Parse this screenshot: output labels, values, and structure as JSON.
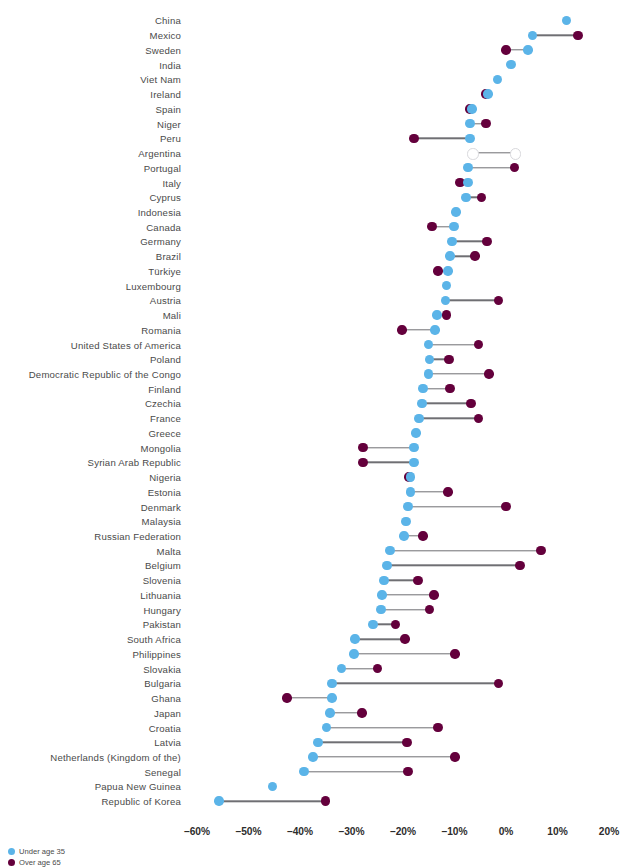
{
  "chart_data": {
    "type": "scatter",
    "subtype": "dumbbell",
    "title": "",
    "xlabel": "",
    "ylabel": "",
    "xlim": [
      -65,
      22
    ],
    "grid": false,
    "legend_position": "bottom-left",
    "axis_ticks": [
      "–60%",
      "–50%",
      "–40%",
      "–30%",
      "–20%",
      "–10%",
      "0%",
      "10%",
      "20%"
    ],
    "axis_tick_values": [
      -60,
      -50,
      -40,
      -30,
      -20,
      -10,
      0,
      10,
      20
    ],
    "series": [
      {
        "name": "Under age 35",
        "color": "#5bb4e8"
      },
      {
        "name": "Over age 65",
        "color": "#64003c"
      }
    ],
    "categories": [
      "China",
      "Mexico",
      "Sweden",
      "India",
      "Viet Nam",
      "Ireland",
      "Spain",
      "Niger",
      "Peru",
      "Argentina",
      "Portugal",
      "Italy",
      "Cyprus",
      "Indonesia",
      "Canada",
      "Germany",
      "Brazil",
      "Türkiye",
      "Luxembourg",
      "Austria",
      "Mali",
      "Romania",
      "United States of America",
      "Poland",
      "Democratic Republic of the Congo",
      "Finland",
      "Czechia",
      "France",
      "Greece",
      "Mongolia",
      "Syrian Arab Republic",
      "Nigeria",
      "Estonia",
      "Denmark",
      "Malaysia",
      "Russian Federation",
      "Malta",
      "Belgium",
      "Slovenia",
      "Lithuania",
      "Hungary",
      "Pakistan",
      "South Africa",
      "Philippines",
      "Slovakia",
      "Bulgaria",
      "Ghana",
      "Japan",
      "Croatia",
      "Latvia",
      "Netherlands (Kingdom of the)",
      "Senegal",
      "Papua New Guinea",
      "Republic of Korea"
    ],
    "rows": [
      {
        "label": "China",
        "under35": 11.7,
        "over65": null
      },
      {
        "label": "Mexico",
        "under35": 5.2,
        "over65": 14.0
      },
      {
        "label": "Sweden",
        "under35": 4.3,
        "over65": 0.0
      },
      {
        "label": "India",
        "under35": 1.0,
        "over65": null
      },
      {
        "label": "Viet Nam",
        "under35": -1.6,
        "over65": null
      },
      {
        "label": "Ireland",
        "under35": -3.5,
        "over65": -3.9
      },
      {
        "label": "Spain",
        "under35": -6.6,
        "over65": -7.0
      },
      {
        "label": "Niger",
        "under35": -7.0,
        "over65": -3.9
      },
      {
        "label": "Peru",
        "under35": -7.0,
        "over65": -17.9
      },
      {
        "label": "Argentina",
        "under35": -6.6,
        "over65": 1.7,
        "hollow": true
      },
      {
        "label": "Portugal",
        "under35": -7.4,
        "over65": 1.7
      },
      {
        "label": "Italy",
        "under35": -7.4,
        "over65": -8.9
      },
      {
        "label": "Cyprus",
        "under35": -7.8,
        "over65": -4.7
      },
      {
        "label": "Indonesia",
        "under35": -9.7,
        "over65": null
      },
      {
        "label": "Canada",
        "under35": -10.1,
        "over65": -14.4
      },
      {
        "label": "Germany",
        "under35": -10.5,
        "over65": -3.7
      },
      {
        "label": "Brazil",
        "under35": -10.9,
        "over65": -6.0
      },
      {
        "label": "Türkiye",
        "under35": -11.3,
        "over65": -13.2
      },
      {
        "label": "Luxembourg",
        "under35": -11.5,
        "over65": null
      },
      {
        "label": "Austria",
        "under35": -11.8,
        "over65": -1.4
      },
      {
        "label": "Mali",
        "under35": -13.4,
        "over65": -11.5
      },
      {
        "label": "Romania",
        "under35": -13.8,
        "over65": -20.2
      },
      {
        "label": "United States of America",
        "under35": -15.1,
        "over65": -5.4
      },
      {
        "label": "Poland",
        "under35": -14.8,
        "over65": -11.1
      },
      {
        "label": "Democratic Republic of the Congo",
        "under35": -15.0,
        "over65": -3.3
      },
      {
        "label": "Finland",
        "under35": -16.1,
        "over65": -10.9
      },
      {
        "label": "Czechia",
        "under35": -16.3,
        "over65": -6.8
      },
      {
        "label": "France",
        "under35": -16.9,
        "over65": -5.4
      },
      {
        "label": "Greece",
        "under35": -17.5,
        "over65": null
      },
      {
        "label": "Mongolia",
        "under35": -17.9,
        "over65": -27.8
      },
      {
        "label": "Syrian Arab Republic",
        "under35": -17.9,
        "over65": -27.8
      },
      {
        "label": "Nigeria",
        "under35": -18.6,
        "over65": -18.8
      },
      {
        "label": "Estonia",
        "under35": -18.6,
        "over65": -11.3
      },
      {
        "label": "Denmark",
        "under35": -19.0,
        "over65": 0.0
      },
      {
        "label": "Malaysia",
        "under35": -19.4,
        "over65": null
      },
      {
        "label": "Russian Federation",
        "under35": -19.8,
        "over65": -16.1
      },
      {
        "label": "Malta",
        "under35": -22.5,
        "over65": 6.8
      },
      {
        "label": "Belgium",
        "under35": -23.1,
        "over65": 2.7
      },
      {
        "label": "Slovenia",
        "under35": -23.7,
        "over65": -17.1
      },
      {
        "label": "Lithuania",
        "under35": -24.1,
        "over65": -14.0
      },
      {
        "label": "Hungary",
        "under35": -24.3,
        "over65": -14.8
      },
      {
        "label": "Pakistan",
        "under35": -25.8,
        "over65": -21.4
      },
      {
        "label": "South Africa",
        "under35": -29.3,
        "over65": -19.6
      },
      {
        "label": "Philippines",
        "under35": -29.5,
        "over65": -9.9
      },
      {
        "label": "Slovakia",
        "under35": -32.0,
        "over65": -24.9
      },
      {
        "label": "Bulgaria",
        "under35": -33.8,
        "over65": -1.4
      },
      {
        "label": "Ghana",
        "under35": -33.8,
        "over65": -42.5
      },
      {
        "label": "Japan",
        "under35": -34.2,
        "over65": -28.0
      },
      {
        "label": "Croatia",
        "under35": -34.8,
        "over65": -13.2
      },
      {
        "label": "Latvia",
        "under35": -36.5,
        "over65": -19.2
      },
      {
        "label": "Netherlands (Kingdom of the)",
        "under35": -37.5,
        "over65": -9.9
      },
      {
        "label": "Senegal",
        "under35": -39.2,
        "over65": -19.0
      },
      {
        "label": "Papua New Guinea",
        "under35": -45.4,
        "over65": null
      },
      {
        "label": "Republic of Korea",
        "under35": -55.7,
        "over65": -35.0
      }
    ]
  },
  "legend": {
    "items": [
      {
        "label": "Under age 35",
        "color": "#5bb4e8",
        "key": "young"
      },
      {
        "label": "Over age 65",
        "color": "#64003c",
        "key": "old"
      }
    ]
  }
}
